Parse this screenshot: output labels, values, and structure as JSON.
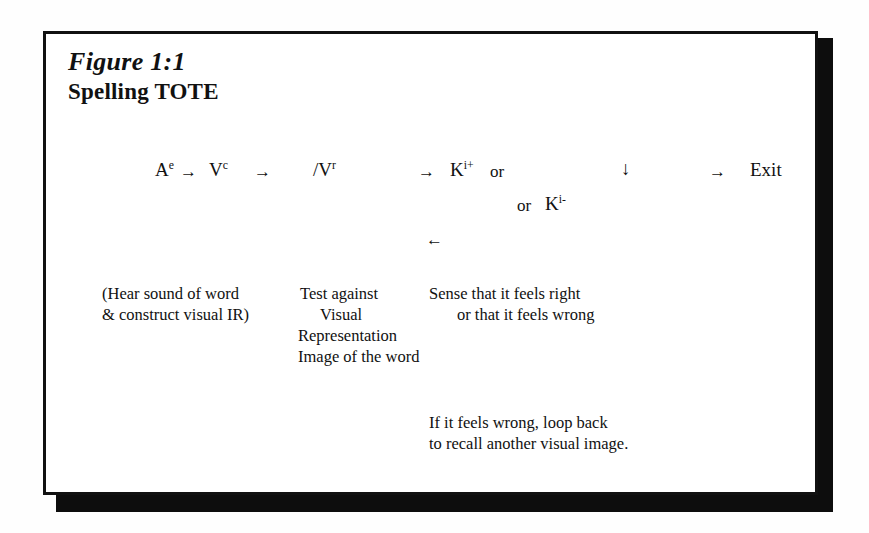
{
  "figure": {
    "number": "Figure 1:1",
    "title": "Spelling TOTE"
  },
  "diagram": {
    "row1": {
      "stage1": "Ae",
      "stage1_base": "A",
      "stage1_sup": "e",
      "arrow1": "→",
      "stage2_base": "V",
      "stage2_sup": "c",
      "arrow2": "→",
      "stage3_base": "/V",
      "stage3_sup": "r",
      "arrow3": "→",
      "stage4_base": "K",
      "stage4_sup": "i+",
      "or1": "or",
      "down_arrow": "↓",
      "arrow4": "→",
      "exit": "Exit"
    },
    "row2": {
      "or2": "or",
      "stage5_base": "K",
      "stage5_sup": "i-"
    },
    "loop_arrow": "←"
  },
  "annotations": {
    "left": {
      "line1": "(Hear sound of word",
      "line2": "& construct visual IR)"
    },
    "middle": {
      "line1": "Test against",
      "line2": "Visual",
      "line3": "Representation",
      "line4": "Image of the word"
    },
    "right": {
      "line1": "Sense that it feels right",
      "line2": "or that it feels wrong"
    },
    "bottom": {
      "line1": "If it feels wrong, loop back",
      "line2": "to recall another visual image."
    }
  },
  "colors": {
    "ink": "#111111",
    "paper": "#ffffff",
    "shadow": "#0d0d0d"
  }
}
